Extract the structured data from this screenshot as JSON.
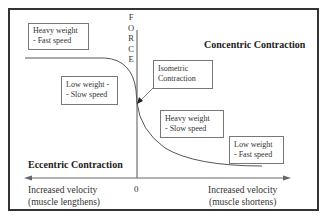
{
  "diagram": {
    "title_left": "Eccentric Contraction",
    "title_right": "Concentric Contraction",
    "y_axis": {
      "label_letters": [
        "F",
        "O",
        "R",
        "C",
        "E"
      ]
    },
    "x_axis": {
      "origin_label": "0",
      "left_label": [
        "Increased velocity",
        "(muscle lengthens)"
      ],
      "right_label": [
        "Increased velocity",
        "(muscle shortens)"
      ]
    },
    "boxes": {
      "heavy_fast": [
        "Heavy weight",
        "- Fast speed"
      ],
      "low_slow": [
        "Low weight -",
        "- Slow speed"
      ],
      "isometric": [
        "Isometric",
        "Contraction"
      ],
      "heavy_slow": [
        "Heavy weight",
        "- Slow speed"
      ],
      "low_fast": [
        "Low weight",
        "- Fast speed"
      ]
    },
    "colors": {
      "line": "#555555",
      "border": "#333333",
      "box_border": "#777777"
    }
  }
}
